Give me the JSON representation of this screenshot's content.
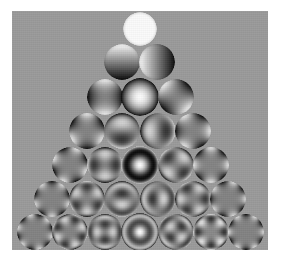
{
  "figure": {
    "panel": {
      "background_color": "#9a9a9a",
      "page_background_color": "#ffffff",
      "x": 12,
      "y": 11,
      "width": 256,
      "height": 239
    },
    "colormap": {
      "name": "greyscale",
      "low_color": "#000000",
      "mid_color": "#9a9a9a",
      "high_color": "#ffffff"
    }
  },
  "chart_data": {
    "type": "heatmap",
    "xlabel": "azimuthal frequency m",
    "ylabel": "radial order n",
    "grid": false,
    "legend": "none",
    "rows": [
      {
        "n": 0,
        "row_index": 0,
        "count": 1,
        "modes": [
          {
            "index": 0,
            "n": 0,
            "m": 0,
            "name": "Piston",
            "pattern": "piston",
            "cx": 140,
            "cy": 29,
            "r": 17
          }
        ]
      },
      {
        "n": 1,
        "row_index": 1,
        "count": 2,
        "modes": [
          {
            "index": 1,
            "n": 1,
            "m": -1,
            "name": "Tilt Y (vertical tilt)",
            "pattern": "tilt-vertical",
            "cx": 122,
            "cy": 62,
            "r": 18
          },
          {
            "index": 2,
            "n": 1,
            "m": 1,
            "name": "Tilt X (horizontal tilt)",
            "pattern": "tilt-horizontal",
            "cx": 157,
            "cy": 62,
            "r": 18
          }
        ]
      },
      {
        "n": 2,
        "row_index": 2,
        "count": 3,
        "modes": [
          {
            "index": 3,
            "n": 2,
            "m": -2,
            "name": "Astigmatism 0 deg",
            "pattern": "astig-vertical",
            "cx": 105,
            "cy": 97,
            "r": 18
          },
          {
            "index": 4,
            "n": 2,
            "m": 0,
            "name": "Defocus",
            "pattern": "defocus",
            "cx": 140,
            "cy": 97,
            "r": 19
          },
          {
            "index": 5,
            "n": 2,
            "m": 2,
            "name": "Astigmatism 45 deg (oblique)",
            "pattern": "astig-oblique",
            "cx": 176,
            "cy": 97,
            "r": 18
          }
        ]
      },
      {
        "n": 3,
        "row_index": 3,
        "count": 4,
        "modes": [
          {
            "index": 6,
            "n": 3,
            "m": -3,
            "name": "Trefoil Y",
            "pattern": "trefoil-y",
            "cx": 87,
            "cy": 131,
            "r": 18
          },
          {
            "index": 7,
            "n": 3,
            "m": -1,
            "name": "Coma Y (vertical coma)",
            "pattern": "coma-vertical",
            "cx": 122,
            "cy": 131,
            "r": 18
          },
          {
            "index": 8,
            "n": 3,
            "m": 1,
            "name": "Coma X (horizontal coma)",
            "pattern": "coma-horizontal",
            "cx": 158,
            "cy": 131,
            "r": 18
          },
          {
            "index": 9,
            "n": 3,
            "m": 3,
            "name": "Trefoil X",
            "pattern": "trefoil-x",
            "cx": 193,
            "cy": 131,
            "r": 18
          }
        ]
      },
      {
        "n": 4,
        "row_index": 4,
        "count": 5,
        "modes": [
          {
            "index": 10,
            "n": 4,
            "m": -4,
            "name": "Quadrafoil Y",
            "pattern": "quadrafoil-y",
            "cx": 70,
            "cy": 165,
            "r": 18
          },
          {
            "index": 11,
            "n": 4,
            "m": -2,
            "name": "Secondary astigmatism Y",
            "pattern": "sec-astig-vertical",
            "cx": 105,
            "cy": 165,
            "r": 18
          },
          {
            "index": 12,
            "n": 4,
            "m": 0,
            "name": "Primary spherical aberration",
            "pattern": "spherical",
            "cx": 140,
            "cy": 165,
            "r": 19
          },
          {
            "index": 13,
            "n": 4,
            "m": 2,
            "name": "Secondary astigmatism X",
            "pattern": "sec-astig-oblique",
            "cx": 176,
            "cy": 165,
            "r": 18
          },
          {
            "index": 14,
            "n": 4,
            "m": 4,
            "name": "Quadrafoil X",
            "pattern": "quadrafoil-x",
            "cx": 211,
            "cy": 165,
            "r": 18
          }
        ]
      },
      {
        "n": 5,
        "row_index": 5,
        "count": 6,
        "modes": [
          {
            "index": 15,
            "n": 5,
            "m": -5,
            "name": "Pentafoil Y",
            "pattern": "pentafoil-y",
            "cx": 52,
            "cy": 199,
            "r": 18
          },
          {
            "index": 16,
            "n": 5,
            "m": -3,
            "name": "Secondary trefoil Y",
            "pattern": "sec-trefoil-y",
            "cx": 87,
            "cy": 199,
            "r": 18
          },
          {
            "index": 17,
            "n": 5,
            "m": -1,
            "name": "Secondary coma Y",
            "pattern": "sec-coma-vertical",
            "cx": 122,
            "cy": 199,
            "r": 18
          },
          {
            "index": 18,
            "n": 5,
            "m": 1,
            "name": "Secondary coma X",
            "pattern": "sec-coma-horizontal",
            "cx": 158,
            "cy": 199,
            "r": 18
          },
          {
            "index": 19,
            "n": 5,
            "m": 3,
            "name": "Secondary trefoil X",
            "pattern": "sec-trefoil-x",
            "cx": 193,
            "cy": 199,
            "r": 18
          },
          {
            "index": 20,
            "n": 5,
            "m": 5,
            "name": "Pentafoil X",
            "pattern": "pentafoil-x",
            "cx": 228,
            "cy": 199,
            "r": 18
          }
        ]
      },
      {
        "n": 6,
        "row_index": 6,
        "count": 7,
        "modes": [
          {
            "index": 21,
            "n": 6,
            "m": -6,
            "name": "Hexafoil Y",
            "pattern": "hexafoil-y",
            "cx": 35,
            "cy": 232,
            "r": 18
          },
          {
            "index": 22,
            "n": 6,
            "m": -4,
            "name": "Secondary quadrafoil Y",
            "pattern": "sec-quadrafoil-y",
            "cx": 70,
            "cy": 232,
            "r": 18
          },
          {
            "index": 23,
            "n": 6,
            "m": -2,
            "name": "Tertiary astigmatism Y",
            "pattern": "ter-astig-vertical",
            "cx": 105,
            "cy": 232,
            "r": 18
          },
          {
            "index": 24,
            "n": 6,
            "m": 0,
            "name": "Secondary spherical aberration",
            "pattern": "sec-spherical",
            "cx": 140,
            "cy": 232,
            "r": 19
          },
          {
            "index": 25,
            "n": 6,
            "m": 2,
            "name": "Tertiary astigmatism X",
            "pattern": "ter-astig-oblique",
            "cx": 176,
            "cy": 232,
            "r": 18
          },
          {
            "index": 26,
            "n": 6,
            "m": 4,
            "name": "Secondary quadrafoil X",
            "pattern": "sec-quadrafoil-x",
            "cx": 211,
            "cy": 232,
            "r": 18
          },
          {
            "index": 27,
            "n": 6,
            "m": 6,
            "name": "Hexafoil X",
            "pattern": "hexafoil-x",
            "cx": 246,
            "cy": 232,
            "r": 18
          }
        ]
      }
    ]
  }
}
